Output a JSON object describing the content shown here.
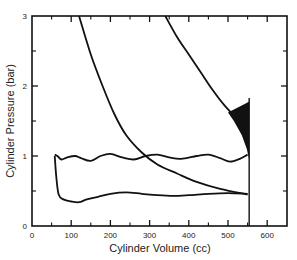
{
  "chart_data": {
    "type": "line",
    "title": "",
    "xlabel": "Cylinder Volume (cc)",
    "ylabel": "Cylinder Pressure (bar)",
    "xlim": [
      0,
      650
    ],
    "ylim": [
      0,
      3
    ],
    "x_ticks": [
      0,
      100,
      200,
      300,
      400,
      500,
      600
    ],
    "x_minor_ticks": [
      50,
      150,
      250,
      350,
      450,
      550
    ],
    "y_ticks": [
      0,
      1,
      2,
      3
    ],
    "y_minor_ticks": [
      0.5,
      1.5,
      2.5
    ],
    "grid": false,
    "legend": null,
    "series": [
      {
        "name": "expansion-curve-left",
        "points": [
          [
            120,
            3.0
          ],
          [
            150,
            2.45
          ],
          [
            180,
            2.0
          ],
          [
            210,
            1.6
          ],
          [
            240,
            1.3
          ],
          [
            280,
            1.05
          ],
          [
            320,
            0.88
          ],
          [
            370,
            0.75
          ],
          [
            420,
            0.63
          ],
          [
            480,
            0.53
          ],
          [
            550,
            0.45
          ]
        ]
      },
      {
        "name": "compression-curve-right",
        "points": [
          [
            340,
            3.0
          ],
          [
            370,
            2.7
          ],
          [
            400,
            2.45
          ],
          [
            430,
            2.2
          ],
          [
            460,
            1.95
          ],
          [
            490,
            1.73
          ],
          [
            520,
            1.55
          ],
          [
            545,
            1.42
          ]
        ]
      },
      {
        "name": "intake-upper",
        "points": [
          [
            58,
            1.02
          ],
          [
            65,
            1.0
          ],
          [
            75,
            0.95
          ],
          [
            90,
            0.98
          ],
          [
            110,
            1.0
          ],
          [
            125,
            0.97
          ],
          [
            150,
            0.93
          ],
          [
            175,
            1.0
          ],
          [
            200,
            1.03
          ],
          [
            230,
            0.98
          ],
          [
            260,
            0.95
          ],
          [
            290,
            1.0
          ],
          [
            320,
            1.02
          ],
          [
            350,
            0.98
          ],
          [
            380,
            0.96
          ],
          [
            420,
            1.0
          ],
          [
            450,
            1.02
          ],
          [
            480,
            0.97
          ],
          [
            505,
            0.92
          ],
          [
            530,
            0.96
          ],
          [
            550,
            1.02
          ]
        ]
      },
      {
        "name": "intake-lower",
        "points": [
          [
            58,
            1.0
          ],
          [
            62,
            0.7
          ],
          [
            68,
            0.45
          ],
          [
            80,
            0.38
          ],
          [
            100,
            0.35
          ],
          [
            120,
            0.34
          ],
          [
            140,
            0.38
          ],
          [
            170,
            0.42
          ],
          [
            200,
            0.46
          ],
          [
            240,
            0.48
          ],
          [
            280,
            0.46
          ],
          [
            320,
            0.44
          ],
          [
            360,
            0.43
          ],
          [
            400,
            0.44
          ],
          [
            450,
            0.46
          ],
          [
            500,
            0.47
          ],
          [
            550,
            0.46
          ]
        ]
      },
      {
        "name": "bdc-vertical",
        "points": [
          [
            554,
            1.83
          ],
          [
            554,
            0
          ]
        ]
      }
    ],
    "annotations": [
      "filled black wedge near V≈510–554 cc between P≈0.95 and P≈1.7"
    ]
  }
}
